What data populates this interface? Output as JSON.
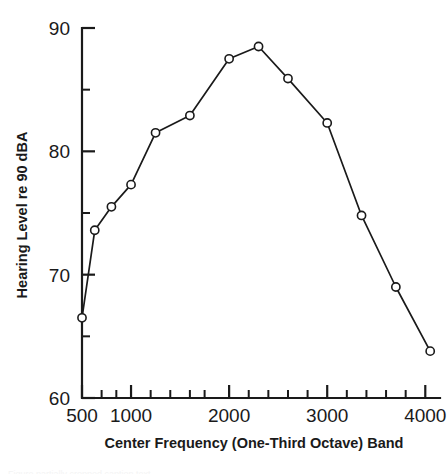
{
  "chart_data": {
    "type": "line",
    "title": "",
    "xlabel": "Center Frequency (One-Third Octave) Band",
    "ylabel": "Hearing Level re 90 dBA",
    "xlim": [
      500,
      4150
    ],
    "ylim": [
      60,
      90
    ],
    "grid": false,
    "legend": null,
    "marker": "open-circle",
    "x": [
      500,
      630,
      800,
      1000,
      1250,
      1600,
      2000,
      2300,
      2600,
      3000,
      3350,
      3700,
      4050
    ],
    "values": [
      66.5,
      73.6,
      75.5,
      77.3,
      81.5,
      82.9,
      87.5,
      88.5,
      85.9,
      82.3,
      74.8,
      69.0,
      63.8
    ],
    "series": [
      {
        "name": "Hearing Level",
        "values": [
          66.5,
          73.6,
          75.5,
          77.3,
          81.5,
          82.9,
          87.5,
          88.5,
          85.9,
          82.3,
          74.8,
          69.0,
          63.8
        ]
      }
    ],
    "x_ticks_major": [
      500,
      1000,
      2000,
      3000,
      4000
    ],
    "x_tick_labels": [
      "500",
      "1000",
      "2000",
      "3000",
      "4000"
    ],
    "x_ticks_minor": [
      700,
      850,
      1200,
      1400,
      1600,
      1750,
      2200,
      2400,
      2600,
      2800,
      3200,
      3400,
      3600,
      3800
    ],
    "y_ticks_major": [
      60,
      70,
      80,
      90
    ],
    "y_tick_labels": [
      "60",
      "70",
      "80",
      "90"
    ],
    "y_ticks_minor": [
      65,
      75,
      85
    ],
    "colors": {
      "line": "#1a1a1a",
      "marker_fill": "#ffffff",
      "axis": "#1a1a1a",
      "background": "#ffffff"
    }
  },
  "caption": {
    "sliver_text": "Figure partially cropped caption text"
  }
}
